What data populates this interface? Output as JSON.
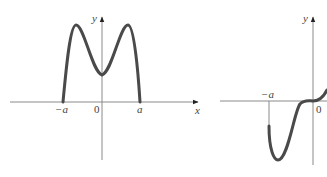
{
  "graphs": [
    {
      "id": "left",
      "description": "Even function: M-shaped curve on [-a, a], zero at ±a, local min at 0, two maxima",
      "x_axis_label": "x",
      "y_axis_label": "y",
      "origin_label": "0",
      "tick_labels": [
        "−a",
        "a"
      ]
    },
    {
      "id": "right",
      "description": "Odd-like function: starts at x=-a below axis, dips to a minimum, rises flat through origin, continues up",
      "y_axis_label": "y",
      "origin_label": "0",
      "tick_labels": [
        "−a"
      ]
    }
  ],
  "colors": {
    "axis": "#8a8a8a",
    "curve": "#4a4a4a",
    "text": "#444444"
  }
}
